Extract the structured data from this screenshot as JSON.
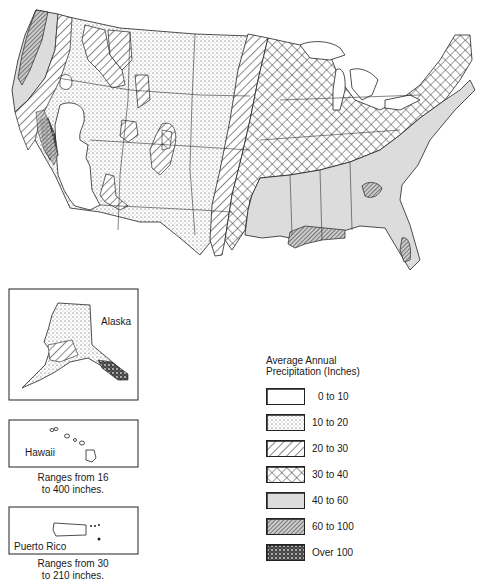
{
  "legend": {
    "title_line1": "Average Annual",
    "title_line2": "Precipitation (Inches)",
    "items": [
      {
        "label": "0 to 10",
        "pattern": "blank",
        "color": "#ffffff"
      },
      {
        "label": "10 to 20",
        "pattern": "stipple",
        "color": "#e6e6e6"
      },
      {
        "label": "20 to 30",
        "pattern": "diagonal-hatch",
        "color": "#ffffff"
      },
      {
        "label": "30 to 40",
        "pattern": "cross-hatch",
        "color": "#ffffff"
      },
      {
        "label": "40 to 60",
        "pattern": "light-gray",
        "color": "#d9d9d9"
      },
      {
        "label": "60 to 100",
        "pattern": "dense-hatch",
        "color": "#8a8a8a"
      },
      {
        "label": "Over 100",
        "pattern": "dark-stipple",
        "color": "#3a3a3a"
      }
    ]
  },
  "insets": {
    "alaska": {
      "label": "Alaska"
    },
    "hawaii": {
      "label": "Hawaii",
      "caption_line1": "Ranges from 16",
      "caption_line2": "to 400 inches."
    },
    "puerto_rico": {
      "label": "Puerto Rico",
      "caption_line1": "Ranges from 30",
      "caption_line2": "to 210 inches."
    }
  }
}
